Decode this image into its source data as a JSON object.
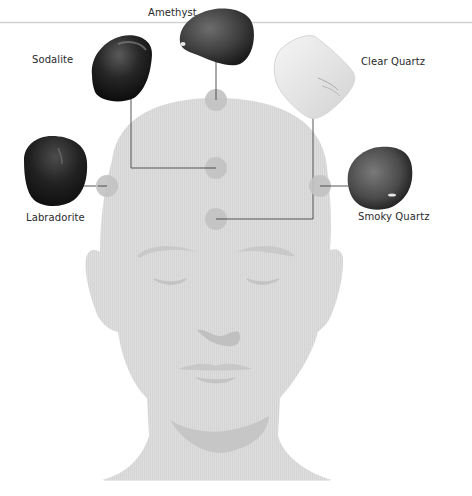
{
  "diagram": {
    "type": "crystal-placement-on-head",
    "colors": {
      "silhouette": "#dcdcdc",
      "silhouette_shade": "#c4c4c4",
      "dot": "#c6c6c6",
      "connector": "#555555",
      "divider": "#cfcfcf",
      "label": "#2a2a2a"
    },
    "stones": [
      {
        "id": "amethyst",
        "label": "Amethyst",
        "placement": "crown"
      },
      {
        "id": "sodalite",
        "label": "Sodalite",
        "placement": "upper forehead center"
      },
      {
        "id": "labradorite",
        "label": "Labradorite",
        "placement": "left temple"
      },
      {
        "id": "smoky-quartz",
        "label": "Smoky Quartz",
        "placement": "right temple"
      },
      {
        "id": "clear-quartz",
        "label": "Clear Quartz",
        "placement": "lower forehead center"
      }
    ]
  }
}
